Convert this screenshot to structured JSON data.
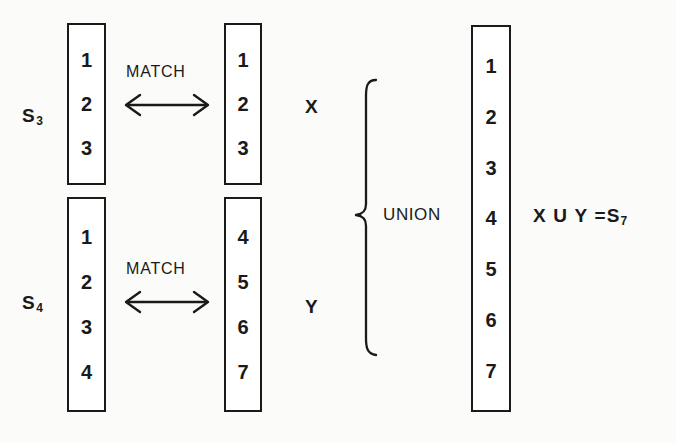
{
  "figure": {
    "background_color": "#fbfbf9",
    "ink_color": "#1a1a1a",
    "rows": [
      {
        "id": "row-top",
        "source_label": "S",
        "source_subscript": "3",
        "source_items": [
          "1",
          "2",
          "3"
        ],
        "relation_label": "MATCH",
        "target_items": [
          "1",
          "2",
          "3"
        ],
        "group_label": "X"
      },
      {
        "id": "row-bottom",
        "source_label": "S",
        "source_subscript": "4",
        "source_items": [
          "1",
          "2",
          "3",
          "4"
        ],
        "relation_label": "MATCH",
        "target_items": [
          "4",
          "5",
          "6",
          "7"
        ],
        "group_label": "Y"
      }
    ],
    "union": {
      "operation_label": "UNION",
      "result_items": [
        "1",
        "2",
        "3",
        "4",
        "5",
        "6",
        "7"
      ],
      "equation": "X U Y =",
      "equation_result_label": "S",
      "equation_result_subscript": "7"
    }
  }
}
